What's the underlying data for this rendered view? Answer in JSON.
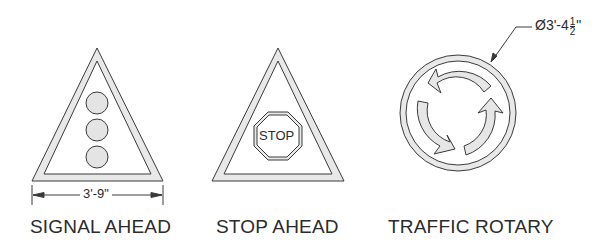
{
  "signs": [
    {
      "id": "signal-ahead",
      "label": "SIGNAL AHEAD",
      "shape": "triangle",
      "symbol": "three-signal-lights",
      "dimension": "3'-9\""
    },
    {
      "id": "stop-ahead",
      "label": "STOP AHEAD",
      "shape": "triangle",
      "symbol": "stop-octagon",
      "symbol_text": "STOP"
    },
    {
      "id": "traffic-rotary",
      "label": "TRAFFIC ROTARY",
      "shape": "circle",
      "symbol": "three-circular-arrows",
      "dimension": {
        "prefix": "Ø3'-4",
        "frac_num": "1",
        "frac_den": "2",
        "suffix": "\""
      }
    }
  ],
  "colors": {
    "line": "#3a3a3a",
    "fill": "#e6e6e6",
    "background": "#ffffff"
  }
}
